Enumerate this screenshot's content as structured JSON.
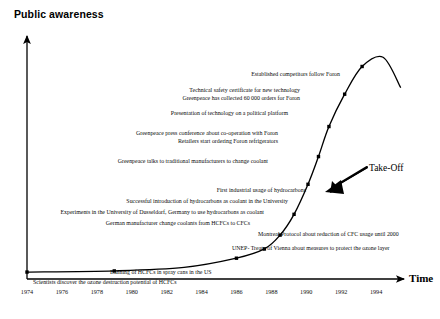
{
  "chart_data": {
    "type": "line",
    "title": "Public awareness",
    "ylabel": "Public awareness",
    "xlabel": "Time",
    "grid": false,
    "legend": null,
    "xlim": [
      1974,
      1995.6
    ],
    "xticks": [
      1974,
      1976,
      1978,
      1980,
      1982,
      1984,
      1986,
      1988,
      1990,
      1992,
      1994
    ],
    "xtick_labels": [
      "1974",
      "1976",
      "1978",
      "1980",
      "1982",
      "1984",
      "1986",
      "1988",
      "1990",
      "1992",
      "1994"
    ],
    "annotation": "Take-Off",
    "series": [
      {
        "name": "Public awareness of HCFC / hydrocarbon issue",
        "x": [
          1974,
          1979,
          1983,
          1986,
          1987.6,
          1988.5,
          1989.3,
          1990.1,
          1990.7,
          1991.3,
          1992.2,
          1993.2,
          1994.4,
          1995.4
        ],
        "values": [
          3,
          3.5,
          5,
          9,
          13,
          19,
          28,
          41,
          53,
          66,
          80,
          92,
          96,
          83
        ],
        "markers": [
          1974,
          1979,
          1986,
          1987.6,
          1988.5,
          1989.3,
          1990.1,
          1990.7,
          1991.3,
          1992.2,
          1993.2
        ]
      }
    ],
    "events": [
      {
        "text": "Established competitors follow  Foron",
        "x": 340,
        "y": 72,
        "align": "right"
      },
      {
        "text": "Technical safety certificate for new technology",
        "x": 300,
        "y": 88,
        "align": "right"
      },
      {
        "text": "Greenpeace has collected 60 000 orders for Foron",
        "x": 300,
        "y": 96,
        "align": "right"
      },
      {
        "text": "Presentation of technology on  a political platform",
        "x": 288,
        "y": 111,
        "align": "right"
      },
      {
        "text": "Greenpeace press conference about co-operation with Foron",
        "x": 278,
        "y": 131,
        "align": "right"
      },
      {
        "text": "Retailers start ordering Foron refrigerators",
        "x": 278,
        "y": 139,
        "align": "right"
      },
      {
        "text": "Greenpeace talks to traditional manufacturers to change coolant",
        "x": 268,
        "y": 159,
        "align": "right"
      },
      {
        "text": "First industrial usage of hydrocarbons",
        "x": 306,
        "y": 188,
        "align": "right"
      },
      {
        "text": "Successful introduction of hydrocarbons as coolant in the University",
        "x": 288,
        "y": 199,
        "align": "right"
      },
      {
        "text": "Experiments in the University of Dusseldorf, Germany to use hydrocarbons as coolant",
        "x": 264,
        "y": 210,
        "align": "right"
      },
      {
        "text": "German manufacturer change coolants from HCFCs to CFCs",
        "x": 250,
        "y": 221,
        "align": "right"
      },
      {
        "text": "Montreal Protocol about reduction of CFC usage until 2000",
        "x": 258,
        "y": 232,
        "align": "left"
      },
      {
        "text": "UNEP- Treaty of Vienna about measures to protect the ozone layer",
        "x": 232,
        "y": 246,
        "align": "left"
      },
      {
        "text": "Banning of HCFCs in  spray cans in the US",
        "x": 110,
        "y": 270,
        "align": "left"
      },
      {
        "text": "Scientists discover the ozone destruction potential of HCFCs",
        "x": 33,
        "y": 280,
        "align": "left"
      }
    ]
  },
  "axes": {
    "y_title": "Public awareness",
    "x_title": "Time"
  }
}
